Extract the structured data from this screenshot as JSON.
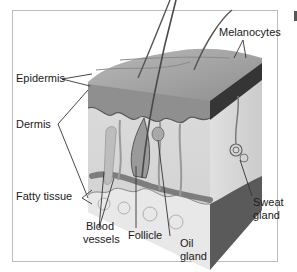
{
  "diagram": {
    "labels": {
      "epidermis": "Epidermis",
      "dermis": "Dermis",
      "fatty_tissue": "Fatty tissue",
      "melanocytes": "Melanocytes",
      "blood_vessels_line1": "Blood",
      "blood_vessels_line2": "vessels",
      "follicle": "Follicle",
      "oil_gland_line1": "Oil",
      "oil_gland_line2": "gland",
      "sweat_gland_line1": "Sweat",
      "sweat_gland_line2": "gland"
    },
    "colors": {
      "frame": "#bdbdbd",
      "epidermis_top": "#9a9a9a",
      "dermis": "#d6d6d6",
      "side_face": "#3a3a3a",
      "fat": "#e6e6e6",
      "vessel": "#7a7a7a",
      "hair": "#555555",
      "leader_line": "#333333"
    }
  }
}
